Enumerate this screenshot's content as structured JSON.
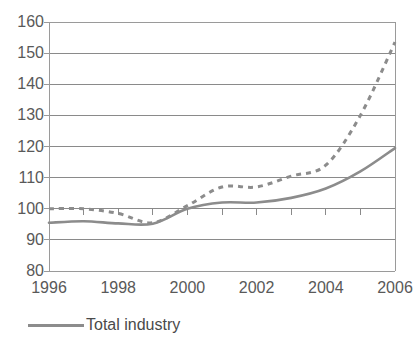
{
  "figure": {
    "title_remnant": "",
    "legend_position": "bottom-left"
  },
  "chart_data": {
    "type": "line",
    "title": "",
    "subtitle": "",
    "xlabel": "",
    "ylabel": "",
    "x": [
      1996,
      1997,
      1998,
      1999,
      2000,
      2001,
      2002,
      2003,
      2004,
      2005,
      2006
    ],
    "xlim": [
      1996,
      2006
    ],
    "ylim": [
      80,
      160
    ],
    "ytick_labels": [
      "160",
      "150",
      "140",
      "130",
      "120",
      "110",
      "100",
      "90",
      "80"
    ],
    "ytick_values": [
      160,
      150,
      140,
      130,
      120,
      110,
      100,
      90,
      80
    ],
    "xtick_labels": [
      "1996",
      "1998",
      "2000",
      "2002",
      "2004",
      "2006"
    ],
    "xtick_values": [
      1996,
      1998,
      2000,
      2002,
      2004,
      2006
    ],
    "xtick_minor_values": [
      1996,
      1997,
      1998,
      1999,
      2000,
      2001,
      2002,
      2003,
      2004,
      2005,
      2006
    ],
    "grid": "horizontal",
    "baseline_value": 100,
    "series": [
      {
        "name": "Total industry",
        "style": "solid",
        "color": "#8c8c8c",
        "in_legend": true,
        "values": [
          95.5,
          96.0,
          95.3,
          95.2,
          100.0,
          102.0,
          102.0,
          103.5,
          106.5,
          112.0,
          119.5
        ]
      },
      {
        "name": "",
        "style": "dashed",
        "color": "#8c8c8c",
        "in_legend": false,
        "values": [
          100.0,
          100.0,
          98.5,
          95.5,
          101.0,
          107.0,
          107.0,
          110.5,
          114.0,
          130.0,
          153.5
        ]
      }
    ],
    "legend": [
      {
        "label": "Total industry",
        "style": "solid",
        "color": "#8c8c8c"
      }
    ]
  },
  "colors": {
    "line": "#8c8c8c",
    "grid": "#8a8a8a",
    "axis": "#9a9a9a",
    "text": "#595959",
    "background": "#ffffff"
  }
}
